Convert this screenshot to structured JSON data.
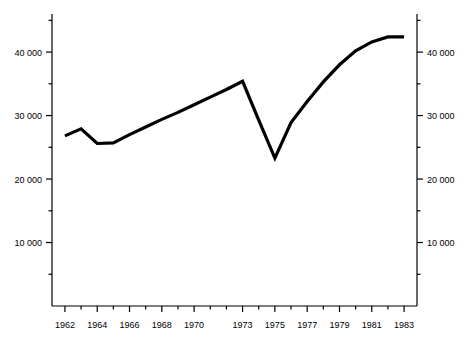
{
  "chart_data": {
    "type": "line",
    "title": "",
    "subtitle": "",
    "xlabel": "",
    "ylabel": "",
    "grid": false,
    "legend": "none",
    "x": [
      1962,
      1963,
      1964,
      1965,
      1966,
      1967,
      1968,
      1969,
      1970,
      1971,
      1972,
      1973,
      1974,
      1975,
      1976,
      1977,
      1978,
      1979,
      1980,
      1981,
      1982,
      1983
    ],
    "values": [
      26800,
      27900,
      25600,
      25700,
      27000,
      28200,
      29400,
      30500,
      31700,
      32900,
      34100,
      35400,
      29300,
      23300,
      28900,
      32200,
      35300,
      38000,
      40200,
      41600,
      42400,
      42400
    ],
    "series": [
      {
        "name": "series-1",
        "values": [
          26800,
          27900,
          25600,
          25700,
          27000,
          28200,
          29400,
          30500,
          31700,
          32900,
          34100,
          35400,
          29300,
          23300,
          28900,
          32200,
          35300,
          38000,
          40200,
          41600,
          42400,
          42400
        ]
      }
    ],
    "xlim": [
      1961.2,
      1983.8
    ],
    "ylim": [
      0,
      46000
    ],
    "x_tick_values": [
      1962,
      1964,
      1966,
      1968,
      1970,
      1973,
      1975,
      1977,
      1979,
      1981,
      1983
    ],
    "x_tick_labels": [
      "1962",
      "1964",
      "1966",
      "1968",
      "1970",
      "1973",
      "1975",
      "1977",
      "1979",
      "1981",
      "1983"
    ],
    "x_minor_ticks": [
      1963,
      1965,
      1967,
      1969,
      1971,
      1972,
      1974,
      1976,
      1978,
      1980,
      1982
    ],
    "y_tick_values": [
      10000,
      20000,
      30000,
      40000
    ],
    "y_tick_labels": [
      "10 000",
      "20 000",
      "30 000",
      "40 000"
    ],
    "y_tick_labels_right": [
      "10 000",
      "20 000",
      "30 000",
      "40 000"
    ],
    "y_minor_ticks": [
      5000,
      15000,
      25000,
      35000,
      45000
    ],
    "axis_color": "#000000",
    "line_color": "#000000",
    "background_color": "#ffffff"
  }
}
